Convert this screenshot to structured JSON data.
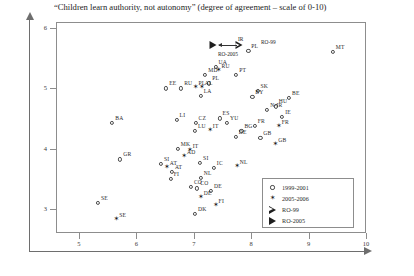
{
  "chart": {
    "title": "“Children learn authority, not autonomy” (degree of agreement – scale of 0-10)"
  },
  "legend": {
    "items": [
      {
        "marker": "circle",
        "label": "1999-2001"
      },
      {
        "marker": "star",
        "label": "2005-2006"
      },
      {
        "marker": "triangle-open",
        "label": "RO-99"
      },
      {
        "marker": "triangle-filled",
        "label": "RO-2005"
      }
    ]
  },
  "annotations": [
    {
      "text": "IR",
      "x": 7.77,
      "y": 5.86
    },
    {
      "text": "RO-99",
      "x": 8.17,
      "y": 5.82
    },
    {
      "text": "RO-2005",
      "x": 7.42,
      "y": 5.62
    }
  ],
  "chart_data": {
    "type": "scatter",
    "title": "“Children learn authority, not autonomy” (degree of agreement – scale of 0-10)",
    "xlabel": "",
    "ylabel": "",
    "xlim": [
      4.6,
      10.0
    ],
    "ylim": [
      2.6,
      6.1
    ],
    "xticks": [
      5,
      6,
      7,
      8,
      9,
      10
    ],
    "yticks": [
      3,
      4,
      5,
      6
    ],
    "grid": false,
    "legend_position": "bottom-right",
    "series": [
      {
        "name": "1999-2001",
        "marker": "circle",
        "points": [
          {
            "label": "PL",
            "x": 7.95,
            "y": 5.62
          },
          {
            "label": "MT",
            "x": 9.42,
            "y": 5.6
          },
          {
            "label": "UA",
            "x": 7.38,
            "y": 5.35
          },
          {
            "label": "PT",
            "x": 7.74,
            "y": 5.22
          },
          {
            "label": "MD",
            "x": 7.2,
            "y": 5.22
          },
          {
            "label": "PL",
            "x": 7.27,
            "y": 5.08
          },
          {
            "label": "EE",
            "x": 6.52,
            "y": 5.0
          },
          {
            "label": "RU",
            "x": 6.78,
            "y": 5.0
          },
          {
            "label": "SK",
            "x": 8.11,
            "y": 4.96
          },
          {
            "label": "LA",
            "x": 7.12,
            "y": 4.88
          },
          {
            "label": "BY",
            "x": 8.02,
            "y": 4.86
          },
          {
            "label": "BE",
            "x": 8.66,
            "y": 4.84
          },
          {
            "label": "HU",
            "x": 8.43,
            "y": 4.7
          },
          {
            "label": "N-IR",
            "x": 8.28,
            "y": 4.64
          },
          {
            "label": "IE",
            "x": 8.54,
            "y": 4.52
          },
          {
            "label": "BA",
            "x": 5.58,
            "y": 4.43
          },
          {
            "label": "LI",
            "x": 6.7,
            "y": 4.48
          },
          {
            "label": "ES",
            "x": 7.45,
            "y": 4.5
          },
          {
            "label": "CZ",
            "x": 7.03,
            "y": 4.42
          },
          {
            "label": "YU",
            "x": 7.58,
            "y": 4.42
          },
          {
            "label": "FR",
            "x": 8.06,
            "y": 4.38
          },
          {
            "label": "BG",
            "x": 7.83,
            "y": 4.3
          },
          {
            "label": "LU",
            "x": 7.02,
            "y": 4.3
          },
          {
            "label": "DE",
            "x": 7.73,
            "y": 4.2
          },
          {
            "label": "GB",
            "x": 8.16,
            "y": 4.18
          },
          {
            "label": "MK",
            "x": 6.72,
            "y": 4.0
          },
          {
            "label": "GR",
            "x": 5.72,
            "y": 3.82
          },
          {
            "label": "SI",
            "x": 6.43,
            "y": 3.74
          },
          {
            "label": "SI",
            "x": 7.11,
            "y": 3.76
          },
          {
            "label": "IC",
            "x": 7.35,
            "y": 3.68
          },
          {
            "label": "AT",
            "x": 6.62,
            "y": 3.62
          },
          {
            "label": "NL",
            "x": 7.12,
            "y": 3.52
          },
          {
            "label": "FI",
            "x": 6.6,
            "y": 3.5
          },
          {
            "label": "CO",
            "x": 6.95,
            "y": 3.36
          },
          {
            "label": "CO",
            "x": 7.06,
            "y": 3.34
          },
          {
            "label": "DE",
            "x": 7.3,
            "y": 3.3
          },
          {
            "label": "SE",
            "x": 5.33,
            "y": 3.1
          },
          {
            "label": "DK",
            "x": 7.02,
            "y": 2.92
          }
        ]
      },
      {
        "name": "2005-2006",
        "marker": "star",
        "points": [
          {
            "label": "RU",
            "x": 7.43,
            "y": 5.28
          },
          {
            "label": "PL",
            "x": 7.03,
            "y": 5.0
          },
          {
            "label": "AL",
            "x": 7.14,
            "y": 5.0
          },
          {
            "label": "IT",
            "x": 7.28,
            "y": 4.3
          },
          {
            "label": "IT",
            "x": 6.93,
            "y": 3.96
          },
          {
            "label": "NL",
            "x": 7.75,
            "y": 3.7
          },
          {
            "label": "AD",
            "x": 6.83,
            "y": 3.86
          },
          {
            "label": "AT",
            "x": 6.53,
            "y": 3.68
          },
          {
            "label": "FR",
            "x": 8.48,
            "y": 4.36
          },
          {
            "label": "GB",
            "x": 8.42,
            "y": 4.06
          },
          {
            "label": "DE",
            "x": 7.12,
            "y": 3.18
          },
          {
            "label": "FI",
            "x": 7.38,
            "y": 3.04
          },
          {
            "label": "SE",
            "x": 5.65,
            "y": 2.82
          }
        ]
      },
      {
        "name": "RO-99",
        "marker": "triangle-open",
        "points": [
          {
            "label": "",
            "x": 7.78,
            "y": 5.72
          }
        ]
      },
      {
        "name": "RO-2005",
        "marker": "triangle-filled",
        "points": [
          {
            "label": "",
            "x": 7.34,
            "y": 5.72
          }
        ]
      }
    ]
  }
}
